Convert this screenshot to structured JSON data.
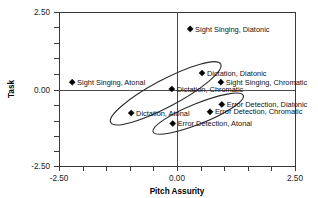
{
  "chart_data": {
    "type": "scatter",
    "title": "",
    "xlabel": "Pitch Assurity",
    "ylabel": "Task",
    "xlim": [
      -2.5,
      2.5
    ],
    "ylim": [
      -2.5,
      2.5
    ],
    "grid": false,
    "zero_lines": true,
    "x_ticks": [
      -2.5,
      0.0,
      2.5
    ],
    "y_ticks": [
      -2.5,
      0.0,
      2.5
    ],
    "x_tick_labels": [
      "-2.50",
      "0.00",
      "2.50"
    ],
    "y_tick_labels": [
      "-2.50",
      "0.00",
      "2.50"
    ],
    "minor_tick_count_per_axis": 10,
    "marker": "diamond",
    "marker_color": "#000000",
    "points": [
      {
        "label": "Sight Singing, Diatonic",
        "x": 0.28,
        "y": 1.95,
        "label_side": "right"
      },
      {
        "label": "Dictation, Diatonic",
        "x": 0.53,
        "y": 0.52,
        "label_side": "right"
      },
      {
        "label": "Sight Singing, Chromatic",
        "x": 0.93,
        "y": 0.22,
        "label_side": "right"
      },
      {
        "label": "Sight Singing, Atonal",
        "x": -2.22,
        "y": 0.22,
        "label_side": "right"
      },
      {
        "label": "Dictation, Chromatic",
        "x": -0.11,
        "y": 0.0,
        "label_side": "right"
      },
      {
        "label": "Error Detection, Diatonic",
        "x": 0.95,
        "y": -0.5,
        "label_side": "right"
      },
      {
        "label": "Error Detection, Chromatic",
        "x": 0.7,
        "y": -0.74,
        "label_side": "right"
      },
      {
        "label": "Dictation, Atonal",
        "x": -0.97,
        "y": -0.78,
        "label_side": "right"
      },
      {
        "label": "Error Detection, Atonal",
        "x": -0.09,
        "y": -1.12,
        "label_side": "right"
      }
    ],
    "ellipses": [
      {
        "name": "dictation-cluster",
        "center_x": -0.24,
        "center_y": -0.14,
        "rx": 1.32,
        "ry": 0.44,
        "rotation_deg": -28
      },
      {
        "name": "error-detection-cluster",
        "center_x": 0.45,
        "center_y": -0.8,
        "rx": 1.03,
        "ry": 0.33,
        "rotation_deg": -22
      }
    ]
  },
  "axes": {
    "y_axis_title": "Task",
    "x_axis_title": "Pitch Assurity"
  }
}
